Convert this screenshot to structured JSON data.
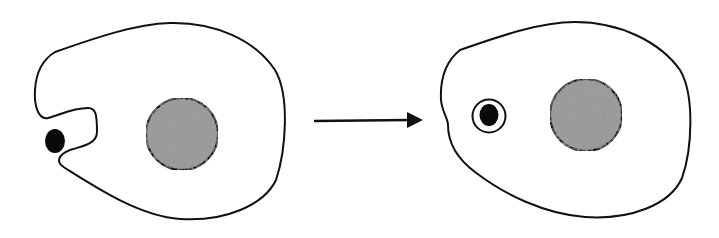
{
  "diagram": {
    "type": "process",
    "stages": [
      {
        "name": "before",
        "elements": [
          "cell-membrane-with-invagination",
          "particle",
          "nucleus"
        ]
      },
      {
        "name": "after",
        "elements": [
          "cell-membrane",
          "vesicle-with-particle",
          "nucleus"
        ]
      }
    ],
    "connector": "arrow-right"
  },
  "colors": {
    "background": "#ffffff",
    "stroke": "#111111",
    "particle": "#0a0a0a",
    "nucleus_fill": "#9a9a9a",
    "nucleus_speckle": "#5a5a5a"
  }
}
